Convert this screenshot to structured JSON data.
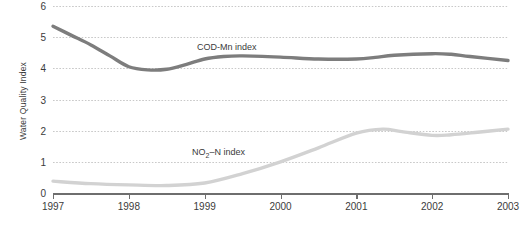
{
  "chart_data": {
    "type": "line",
    "title": "",
    "xlabel": "",
    "ylabel": "Water Quality Index",
    "xlim": [
      1997,
      2003
    ],
    "ylim": [
      0,
      6
    ],
    "grid": true,
    "legend_position": "inline-annotation",
    "xticks": [
      "1997",
      "1998",
      "1999",
      "2000",
      "2001",
      "2002",
      "2003"
    ],
    "yticks": [
      "0",
      "1",
      "2",
      "3",
      "4",
      "5",
      "6"
    ],
    "series": [
      {
        "name": "COD-Mn index",
        "color": "#7d7d7d",
        "label_html": "COD-Mn index",
        "x": [
          1997.0,
          1997.25,
          1997.5,
          1997.75,
          1998.0,
          1998.25,
          1998.5,
          1998.75,
          1999.0,
          1999.25,
          1999.5,
          2000.0,
          2000.5,
          2001.0,
          2001.25,
          2001.5,
          2002.0,
          2002.25,
          2002.5,
          2003.0
        ],
        "values": [
          5.35,
          5.05,
          4.75,
          4.4,
          4.05,
          3.95,
          3.97,
          4.12,
          4.3,
          4.38,
          4.4,
          4.36,
          4.3,
          4.3,
          4.35,
          4.42,
          4.47,
          4.45,
          4.38,
          4.25
        ]
      },
      {
        "name": "NO2-N index",
        "color": "#d2d2d2",
        "label_html": "NO<sub>2</sub>&#8211;N index",
        "x": [
          1997.0,
          1997.5,
          1998.0,
          1998.5,
          1999.0,
          1999.5,
          2000.0,
          2000.5,
          2001.0,
          2001.35,
          2001.6,
          2002.0,
          2002.25,
          2002.6,
          2003.0
        ],
        "values": [
          0.38,
          0.3,
          0.26,
          0.24,
          0.32,
          0.62,
          1.0,
          1.45,
          1.92,
          2.05,
          1.97,
          1.85,
          1.87,
          1.95,
          2.05
        ]
      }
    ]
  }
}
